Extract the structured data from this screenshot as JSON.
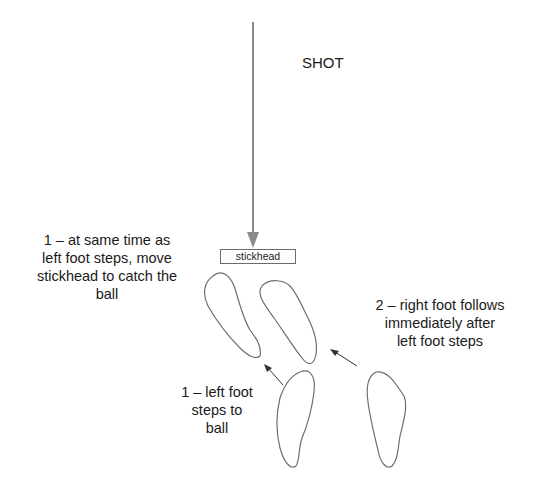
{
  "diagram": {
    "title_label": "SHOT",
    "stickhead_label": "stickhead",
    "annotations": {
      "stickhead_move": [
        "1 – at same time as",
        "left foot steps, move",
        "stickhead to catch the",
        "ball"
      ],
      "right_foot": [
        "2 – right foot follows",
        "immediately after",
        "left foot steps"
      ],
      "left_foot": [
        "1 – left foot",
        "steps to",
        "ball"
      ]
    },
    "colors": {
      "shot_arrow": "#8a8a8a",
      "footprint_outline": "#6e6e6e",
      "step_arrow": "#333333",
      "text": "#1a1a1a"
    },
    "elements": {
      "shot_arrow": "vertical arrow from top to stickhead",
      "footprints": [
        "left-foot-start",
        "right-foot-start",
        "left-foot-end",
        "right-foot-end"
      ],
      "step_arrows": [
        "left-foot-step-arrow",
        "right-foot-step-arrow"
      ]
    }
  }
}
